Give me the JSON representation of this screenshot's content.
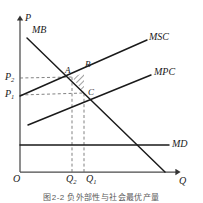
{
  "figure": {
    "caption": "图2-2  负外部性与社会最优产量"
  },
  "axes": {
    "y_label": "P",
    "x_label": "Q",
    "origin_label": "O",
    "y_ticks": [
      {
        "label": "P",
        "sub": "2",
        "y": 78
      },
      {
        "label": "P",
        "sub": "1",
        "y": 95
      }
    ],
    "x_ticks": [
      {
        "label": "Q",
        "sub": "2",
        "x": 72
      },
      {
        "label": "Q",
        "sub": "1",
        "x": 84
      }
    ]
  },
  "curves": [
    {
      "name": "MB",
      "label": "MB",
      "kind": "line",
      "x1": 27,
      "y1": 38,
      "x2": 165,
      "y2": 172,
      "label_x": 32,
      "label_y": 25
    },
    {
      "name": "MSC",
      "label": "MSC",
      "kind": "line",
      "x1": 20,
      "y1": 96,
      "x2": 147,
      "y2": 40,
      "label_x": 149,
      "label_y": 32
    },
    {
      "name": "MPC",
      "label": "MPC",
      "kind": "line",
      "x1": 28,
      "y1": 125,
      "x2": 151,
      "y2": 75,
      "label_x": 154,
      "label_y": 67
    },
    {
      "name": "MD",
      "label": "MD",
      "kind": "line",
      "x1": 20,
      "y1": 145,
      "x2": 169,
      "y2": 145,
      "label_x": 172,
      "label_y": 139
    }
  ],
  "points": [
    {
      "name": "A",
      "label": "A",
      "x": 72,
      "y": 77,
      "label_x": 65,
      "label_y": 66
    },
    {
      "name": "B",
      "label": "B",
      "x": 84,
      "y": 73,
      "label_x": 85,
      "label_y": 60
    },
    {
      "name": "C",
      "label": "C",
      "x": 84,
      "y": 93,
      "label_x": 88,
      "label_y": 92
    }
  ],
  "shaded_region": {
    "name": "welfare-loss-triangle",
    "vertices": "72,77 84,73 84,93",
    "pattern": "diagonal-hatch"
  },
  "guides": [
    {
      "name": "p2-to-a",
      "x1": 20,
      "y1": 78,
      "x2": 72,
      "y2": 77
    },
    {
      "name": "p1-to-c",
      "x1": 20,
      "y1": 95,
      "x2": 84,
      "y2": 93
    },
    {
      "name": "q2-to-a",
      "x1": 72,
      "y1": 172,
      "x2": 72,
      "y2": 77
    },
    {
      "name": "q1-to-c",
      "x1": 84,
      "y1": 172,
      "x2": 84,
      "y2": 93
    }
  ],
  "colors": {
    "ink": "#1a1a1a",
    "axis": "#4a4a4a",
    "guide": "#6b6b6b",
    "hatch": "#2a2a2a",
    "background": "#ffffff",
    "caption": "#5a5a5a"
  }
}
